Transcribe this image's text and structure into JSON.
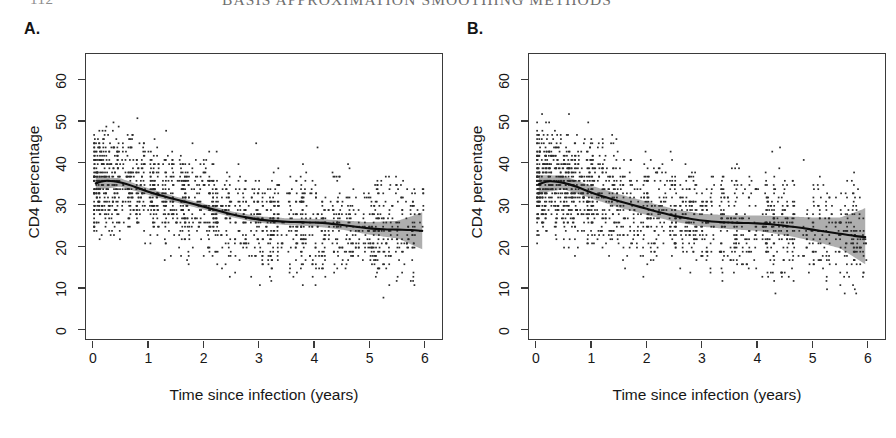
{
  "running_head": {
    "folio": "112",
    "title": "BASIS APPROXIMATION SMOOTHING METHODS"
  },
  "figure": {
    "panels": [
      {
        "letter": "A.",
        "name": "panel-a",
        "axis": {
          "xlabel": "Time since infection (years)",
          "ylabel": "CD4 percentage",
          "xticks": [
            "0",
            "1",
            "2",
            "3",
            "4",
            "5",
            "6"
          ],
          "yticks": [
            "0",
            "10",
            "20",
            "30",
            "40",
            "50",
            "60"
          ],
          "xlim": [
            0,
            6
          ],
          "ylim": [
            0,
            64
          ]
        }
      },
      {
        "letter": "B.",
        "name": "panel-b",
        "axis": {
          "xlabel": "Time since infection (years)",
          "ylabel": "CD4 percentage",
          "xticks": [
            "0",
            "1",
            "2",
            "3",
            "4",
            "5",
            "6"
          ],
          "yticks": [
            "0",
            "10",
            "20",
            "30",
            "40",
            "50",
            "60"
          ],
          "xlim": [
            0,
            6
          ],
          "ylim": [
            0,
            64
          ]
        }
      }
    ],
    "colors": {
      "point": "#2b2b2b",
      "curve": "#0d0d0d",
      "band": "#a0a0a0",
      "frame": "#3a3a3a",
      "text": "#171717"
    }
  },
  "chart_data": [
    {
      "type": "scatter",
      "panel": "A.",
      "title": "",
      "xlabel": "Time since infection (years)",
      "ylabel": "CD4 percentage",
      "xlim": [
        0,
        6
      ],
      "ylim": [
        0,
        64
      ],
      "xticks": [
        0,
        1,
        2,
        3,
        4,
        5,
        6
      ],
      "yticks": [
        0,
        10,
        20,
        30,
        40,
        50,
        60
      ],
      "grid": false,
      "legend": "none",
      "series": [
        {
          "name": "CD4 observations",
          "type": "scatter",
          "marker": "small filled square",
          "n_points": 1760,
          "x_concentration": "visit-clustered vertical stripes, densest between 0 and 1.6 years",
          "y_range": [
            0,
            63
          ]
        },
        {
          "name": "fitted smooth",
          "type": "line",
          "x": [
            0.05,
            0.25,
            0.5,
            0.75,
            1.0,
            1.25,
            1.5,
            1.75,
            2.0,
            2.25,
            2.5,
            2.75,
            3.0,
            3.25,
            3.5,
            3.75,
            4.0,
            4.25,
            4.5,
            4.75,
            5.0,
            5.25,
            5.5,
            5.75,
            5.95
          ],
          "y": [
            35.4,
            36.0,
            35.6,
            34.6,
            33.4,
            32.4,
            31.5,
            30.7,
            29.8,
            28.9,
            28.0,
            27.3,
            26.7,
            26.4,
            26.2,
            26.1,
            26.0,
            25.8,
            25.4,
            25.0,
            24.6,
            24.4,
            24.3,
            24.2,
            24.0
          ]
        },
        {
          "name": "confidence band lower",
          "type": "area-bound",
          "x": [
            0.05,
            0.5,
            1.0,
            1.5,
            2.0,
            2.5,
            3.0,
            3.5,
            4.0,
            4.5,
            5.0,
            5.5,
            5.95
          ],
          "y": [
            33.9,
            34.6,
            32.6,
            30.8,
            29.1,
            27.3,
            25.9,
            25.4,
            25.1,
            24.3,
            23.1,
            22.2,
            19.6
          ]
        },
        {
          "name": "confidence band upper",
          "type": "area-bound",
          "x": [
            0.05,
            0.5,
            1.0,
            1.5,
            2.0,
            2.5,
            3.0,
            3.5,
            4.0,
            4.5,
            5.0,
            5.5,
            5.95
          ],
          "y": [
            36.9,
            36.6,
            34.2,
            32.2,
            30.5,
            28.7,
            27.5,
            27.0,
            26.9,
            26.5,
            26.1,
            26.4,
            28.4
          ]
        }
      ]
    },
    {
      "type": "scatter",
      "panel": "B.",
      "title": "",
      "xlabel": "Time since infection (years)",
      "ylabel": "CD4 percentage",
      "xlim": [
        0,
        6
      ],
      "ylim": [
        0,
        64
      ],
      "xticks": [
        0,
        1,
        2,
        3,
        4,
        5,
        6
      ],
      "yticks": [
        0,
        10,
        20,
        30,
        40,
        50,
        60
      ],
      "grid": false,
      "legend": "none",
      "series": [
        {
          "name": "CD4 observations",
          "type": "scatter",
          "marker": "small filled square",
          "n_points": 1760,
          "x_concentration": "visit-clustered vertical stripes, densest between 0 and 1.6 years",
          "y_range": [
            0,
            63
          ]
        },
        {
          "name": "fitted smooth",
          "type": "line",
          "x": [
            0.05,
            0.25,
            0.5,
            0.75,
            1.0,
            1.25,
            1.5,
            1.75,
            2.0,
            2.25,
            2.5,
            2.75,
            3.0,
            3.25,
            3.5,
            3.75,
            4.0,
            4.25,
            4.5,
            4.75,
            5.0,
            5.25,
            5.5,
            5.75,
            5.95
          ],
          "y": [
            35.2,
            35.9,
            35.5,
            34.5,
            33.2,
            32.1,
            31.1,
            30.2,
            29.3,
            28.4,
            27.6,
            27.0,
            26.5,
            26.2,
            26.0,
            25.9,
            25.8,
            25.6,
            25.2,
            24.8,
            24.3,
            23.8,
            23.3,
            22.8,
            22.5
          ]
        },
        {
          "name": "confidence band lower",
          "type": "area-bound",
          "x": [
            0.05,
            0.5,
            1.0,
            1.5,
            2.0,
            2.5,
            3.0,
            3.5,
            4.0,
            4.5,
            5.0,
            5.5,
            5.95
          ],
          "y": [
            33.0,
            34.0,
            31.8,
            29.6,
            27.8,
            26.2,
            25.0,
            24.4,
            24.0,
            23.0,
            21.6,
            19.8,
            16.0
          ]
        },
        {
          "name": "confidence band upper",
          "type": "area-bound",
          "x": [
            0.05,
            0.5,
            1.0,
            1.5,
            2.0,
            2.5,
            3.0,
            3.5,
            4.0,
            4.5,
            5.0,
            5.5,
            5.95
          ],
          "y": [
            37.4,
            37.2,
            34.8,
            32.8,
            31.0,
            29.2,
            28.1,
            27.7,
            27.7,
            27.5,
            27.2,
            27.2,
            29.4
          ]
        }
      ]
    }
  ]
}
